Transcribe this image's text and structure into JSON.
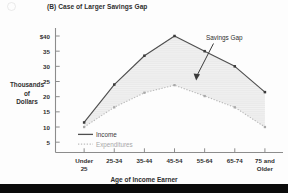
{
  "chart_data": {
    "type": "line",
    "title": "(B) Case of Larger Savings Gap",
    "xlabel": "Age of Income Earner",
    "ylabel": "Thousands of Dollars",
    "ylabel_lines": [
      "Thousands",
      "of",
      "Dollars"
    ],
    "categories": [
      "Under 25",
      "25-34",
      "35-44",
      "45-54",
      "55-64",
      "65-74",
      "75 and Older"
    ],
    "category_lines": [
      [
        "Under",
        "25"
      ],
      [
        "25-34",
        ""
      ],
      [
        "35-44",
        ""
      ],
      [
        "45-54",
        ""
      ],
      [
        "55-64",
        ""
      ],
      [
        "65-74",
        ""
      ],
      [
        "75 and",
        "Older"
      ]
    ],
    "series": [
      {
        "name": "Income",
        "values": [
          11.5,
          24.0,
          33.5,
          40.0,
          35.0,
          30.0,
          21.5
        ],
        "style": "solid"
      },
      {
        "name": "Expenditures",
        "values": [
          10.0,
          16.5,
          21.3,
          23.8,
          20.2,
          16.5,
          10.0
        ],
        "style": "dotted"
      }
    ],
    "ylim": [
      0,
      41
    ],
    "yticks": [
      5,
      10,
      15,
      20,
      25,
      30,
      35,
      40
    ],
    "ytick_labels": [
      "5",
      "10",
      "15",
      "20",
      "25",
      "30",
      "35",
      "$40"
    ],
    "grid": false,
    "legend_position": "inside-lower-left",
    "annotations": [
      {
        "text": "Savings Gap",
        "points_to": "shaded-region-between-curves"
      }
    ],
    "fill_label": "Savings Gap",
    "colors": {
      "income_line": "#4a4a4a",
      "expenditures_line": "#b4b4b4",
      "fill": "#f2f2f2",
      "axis": "#8c8c8c",
      "text": "#2f2f2f",
      "footer_bar": "#0b0b0b"
    }
  },
  "legend": {
    "items": [
      {
        "label": "Income"
      },
      {
        "label": "Expenditures"
      }
    ]
  },
  "annotation": {
    "savings_gap_label": "Savings Gap"
  }
}
